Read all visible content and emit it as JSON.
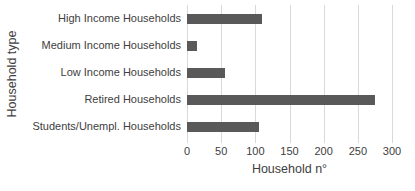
{
  "chart_data": {
    "type": "bar",
    "orientation": "horizontal",
    "categories": [
      "High Income Households",
      "Medium Income Households",
      "Low Income Households",
      "Retired Households",
      "Students/Unempl. Households"
    ],
    "values": [
      110,
      15,
      55,
      275,
      105
    ],
    "xlabel": "Household n°",
    "ylabel": "Household type",
    "xlim": [
      0,
      300
    ],
    "xticks": [
      0,
      50,
      100,
      150,
      200,
      250,
      300
    ],
    "grid": "vertical",
    "legend": "none",
    "colors": {
      "bar": "#595959",
      "gridline": "#D9D9D9",
      "text": "#404040",
      "background": "#FFFFFF"
    }
  }
}
